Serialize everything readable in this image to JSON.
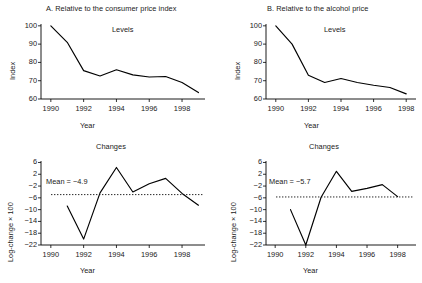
{
  "figure": {
    "background": "#ffffff",
    "ink": "#000000"
  },
  "chart_data": [
    {
      "id": "panel-a-levels",
      "type": "line",
      "title": "A. Relative to the consumer price index",
      "subtitle": "Levels",
      "xlabel": "Year",
      "ylabel": "Index",
      "xlim": [
        1989.4,
        1999.4
      ],
      "ylim": [
        60,
        101
      ],
      "xticks": [
        1990,
        1992,
        1994,
        1996,
        1998
      ],
      "xticklabels": [
        "1990",
        "1992",
        "1994",
        "1996",
        "1998"
      ],
      "yticks": [
        60,
        70,
        80,
        90,
        100
      ],
      "yticklabels": [
        "60",
        "70",
        "80",
        "90",
        "100"
      ],
      "grid": false,
      "legend": "none",
      "x": [
        1990,
        1991,
        1992,
        1993,
        1994,
        1995,
        1996,
        1997,
        1998,
        1999
      ],
      "values": [
        100.0,
        91.0,
        75.5,
        72.6,
        76.0,
        73.2,
        72.0,
        72.3,
        69.0,
        63.5
      ]
    },
    {
      "id": "panel-b-levels",
      "type": "line",
      "title": "B. Relative to the alcohol price",
      "subtitle": "Levels",
      "xlabel": "Year",
      "ylabel": "Index",
      "xlim": [
        1989.4,
        1998.6
      ],
      "ylim": [
        60,
        101
      ],
      "xticks": [
        1990,
        1992,
        1994,
        1996,
        1998
      ],
      "xticklabels": [
        "1990",
        "1992",
        "1994",
        "1996",
        "1998"
      ],
      "yticks": [
        60,
        70,
        80,
        90,
        100
      ],
      "yticklabels": [
        "60",
        "70",
        "80",
        "90",
        "100"
      ],
      "grid": false,
      "legend": "none",
      "x": [
        1990,
        1991,
        1992,
        1993,
        1994,
        1995,
        1996,
        1997,
        1998
      ],
      "values": [
        100.0,
        90.0,
        73.0,
        69.0,
        71.2,
        69.0,
        67.5,
        66.3,
        62.8
      ]
    },
    {
      "id": "panel-c-changes",
      "type": "line",
      "title": "Changes",
      "xlabel": "Year",
      "ylabel": "Log-change × 100",
      "xlim": [
        1989.4,
        1999.4
      ],
      "ylim": [
        -22,
        6.5
      ],
      "xticks": [
        1990,
        1992,
        1994,
        1996,
        1998
      ],
      "xticklabels": [
        "1990",
        "1992",
        "1994",
        "1996",
        "1998"
      ],
      "yticks": [
        6,
        2,
        -2,
        -6,
        -10,
        -14,
        -18,
        -22
      ],
      "yticklabels": [
        "6",
        "2",
        "−2",
        "−6",
        "−10",
        "−14",
        "−18",
        "−22"
      ],
      "grid": false,
      "legend": "none",
      "x": [
        1991,
        1992,
        1993,
        1994,
        1995,
        1996,
        1997,
        1998,
        1999
      ],
      "values": [
        -8.8,
        -20.0,
        -4.3,
        4.3,
        -4.0,
        -1.2,
        0.6,
        -4.5,
        -8.5
      ],
      "annotation": {
        "text": "Mean = −4.9",
        "mean_value": -4.9,
        "line_style": "dotted"
      }
    },
    {
      "id": "panel-d-changes",
      "type": "line",
      "title": "Changes",
      "xlabel": "Year",
      "ylabel": "Log-change × 100",
      "xlim": [
        1989.4,
        1999.2
      ],
      "ylim": [
        -22,
        6.5
      ],
      "xticks": [
        1990,
        1992,
        1994,
        1996,
        1998
      ],
      "xticklabels": [
        "1990",
        "1992",
        "1994",
        "1996",
        "1998"
      ],
      "yticks": [
        6,
        2,
        -2,
        -6,
        -10,
        -14,
        -18,
        -22
      ],
      "yticklabels": [
        "6",
        "2",
        "−2",
        "−6",
        "−10",
        "−14",
        "−18",
        "−22"
      ],
      "grid": false,
      "legend": "none",
      "x": [
        1991,
        1992,
        1993,
        1994,
        1995,
        1996,
        1997,
        1998
      ],
      "values": [
        -10.0,
        -22.0,
        -5.8,
        3.0,
        -3.8,
        -2.8,
        -1.5,
        -5.6
      ],
      "annotation": {
        "text": "Mean = −5.7",
        "mean_value": -5.7,
        "line_style": "dotted"
      }
    }
  ]
}
